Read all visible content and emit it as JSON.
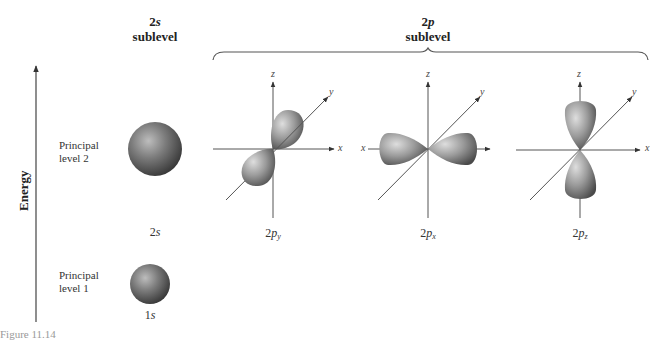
{
  "header": {
    "s_sublevel": {
      "prefix": "2",
      "letter": "s",
      "word": "sublevel"
    },
    "p_sublevel": {
      "prefix": "2",
      "letter": "p",
      "word": "sublevel"
    }
  },
  "energy_axis": {
    "label": "Energy"
  },
  "levels": [
    {
      "label_line1": "Principal",
      "label_line2": "level 2"
    },
    {
      "label_line1": "Principal",
      "label_line2": "level 1"
    }
  ],
  "orbitals": {
    "s2": {
      "prefix": "2",
      "letter": "s"
    },
    "s1": {
      "prefix": "1",
      "letter": "s"
    },
    "py": {
      "prefix": "2",
      "letter": "p",
      "sub": "y"
    },
    "px": {
      "prefix": "2",
      "letter": "p",
      "sub": "x"
    },
    "pz": {
      "prefix": "2",
      "letter": "p",
      "sub": "z"
    }
  },
  "axis_labels": {
    "x": "x",
    "y": "y",
    "z": "z"
  },
  "caption": {
    "text": "Figure 11.14"
  },
  "colors": {
    "orbital_dark": "#3c3c3c",
    "orbital_mid": "#8a8a8a",
    "orbital_light": "#d9d9d9",
    "axis": "#555555"
  }
}
